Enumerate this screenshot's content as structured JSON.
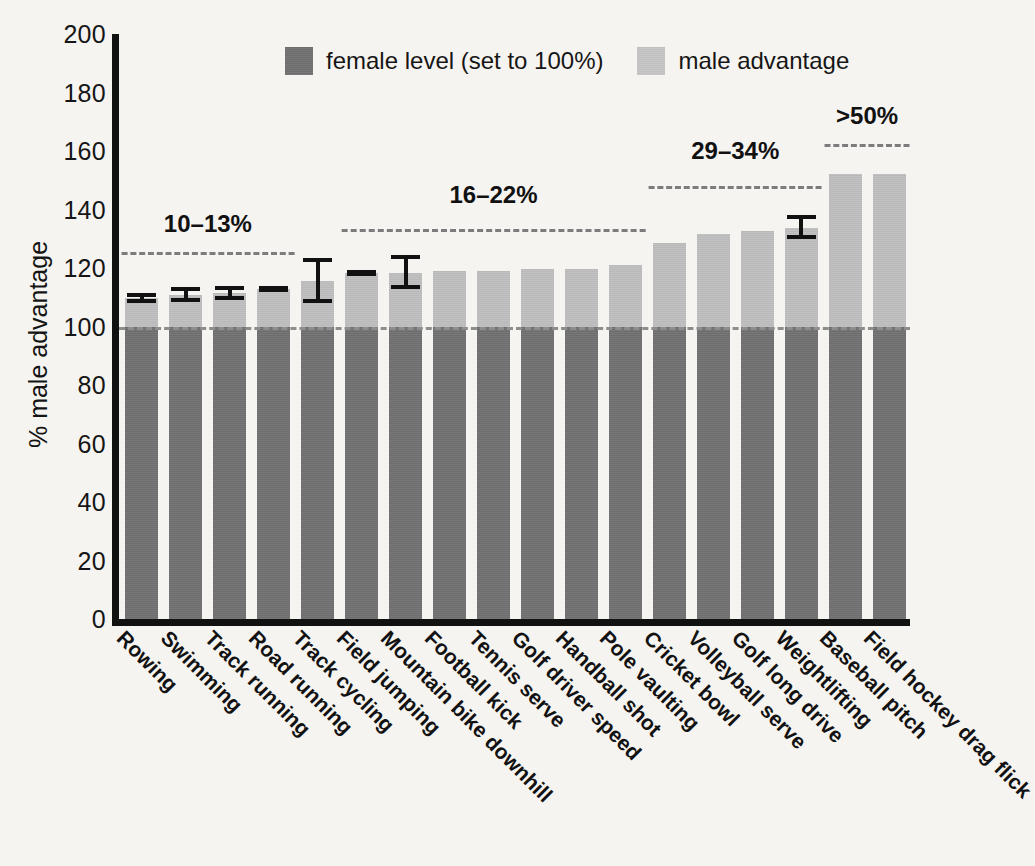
{
  "chart_data": {
    "type": "bar",
    "title": "",
    "subtitle": "",
    "xlabel": "",
    "ylabel": "% male advantage",
    "ylim": [
      0,
      200
    ],
    "ytick_step": 20,
    "yticks": [
      200,
      180,
      160,
      140,
      120,
      100,
      80,
      60,
      40,
      20,
      0
    ],
    "grid": false,
    "legend_position": "top-center",
    "reference_line": 100,
    "stacked": true,
    "categories": [
      "Rowing",
      "Swimming",
      "Track running",
      "Road running",
      "Track cycling",
      "Field jumping",
      "Mountain bike downhill",
      "Football kick",
      "Tennis serve",
      "Golf driver speed",
      "Handball shot",
      "Pole vaulting",
      "Cricket bowl",
      "Volleyball serve",
      "Golf long drive",
      "Weightlifting",
      "Baseball pitch",
      "Field hockey drag flick"
    ],
    "series": [
      {
        "name": "female level (set to 100%)",
        "color": "#6d6d6d",
        "values": [
          100,
          100,
          100,
          100,
          100,
          100,
          100,
          100,
          100,
          100,
          100,
          100,
          100,
          100,
          100,
          100,
          100,
          100
        ]
      },
      {
        "name": "male advantage",
        "color": "#b9b9b9",
        "values": [
          9.8,
          10.9,
          11.4,
          12.8,
          15.5,
          18.2,
          18.3,
          19.0,
          19.0,
          19.6,
          19.6,
          21.0,
          28.4,
          31.6,
          32.8,
          33.8,
          52.0,
          52.0
        ]
      }
    ],
    "totals": [
      109.8,
      110.9,
      111.4,
      112.8,
      115.5,
      118.2,
      118.3,
      119.0,
      119.0,
      119.6,
      119.6,
      121.0,
      128.4,
      131.6,
      132.8,
      133.8,
      152.0,
      152.0
    ],
    "error_bars": [
      {
        "index": 0,
        "category": "Rowing",
        "low": 108.0,
        "high": 111.5
      },
      {
        "index": 1,
        "category": "Swimming",
        "low": 108.5,
        "high": 113.5
      },
      {
        "index": 2,
        "category": "Track running",
        "low": 109.0,
        "high": 113.8
      },
      {
        "index": 3,
        "category": "Road running",
        "low": 111.8,
        "high": 113.8
      },
      {
        "index": 4,
        "category": "Track cycling",
        "low": 108.0,
        "high": 123.5
      },
      {
        "index": 5,
        "category": "Field jumping",
        "low": 117.2,
        "high": 119.2
      },
      {
        "index": 6,
        "category": "Mountain bike downhill",
        "low": 112.8,
        "high": 124.5
      },
      {
        "index": 15,
        "category": "Weightlifting",
        "low": 130.0,
        "high": 138.0
      }
    ],
    "annotations": [
      {
        "label": "10–13%",
        "span_start_index": 0,
        "span_end_index": 3,
        "label_y": 134.0,
        "rule_y": 125.5
      },
      {
        "label": "16–22%",
        "span_start_index": 5,
        "span_end_index": 11,
        "label_y": 144.0,
        "rule_y": 133.5
      },
      {
        "label": "29–34%",
        "span_start_index": 12,
        "span_end_index": 15,
        "label_y": 159.0,
        "rule_y": 148.0
      },
      {
        "label": ">50%",
        "span_start_index": 16,
        "span_end_index": 17,
        "label_y": 171.0,
        "rule_y": 162.5
      }
    ]
  },
  "legend": {
    "items": [
      {
        "label": "female level (set to 100%)",
        "swatch": "female"
      },
      {
        "label": "male advantage",
        "swatch": "male"
      }
    ]
  },
  "colors": {
    "background": "#f6f4f0",
    "axis": "#111111",
    "female": "#6d6d6d",
    "male": "#b9b9b9",
    "reference_line": "#8d8d8d",
    "annotation_rule": "#7c7c7c"
  }
}
